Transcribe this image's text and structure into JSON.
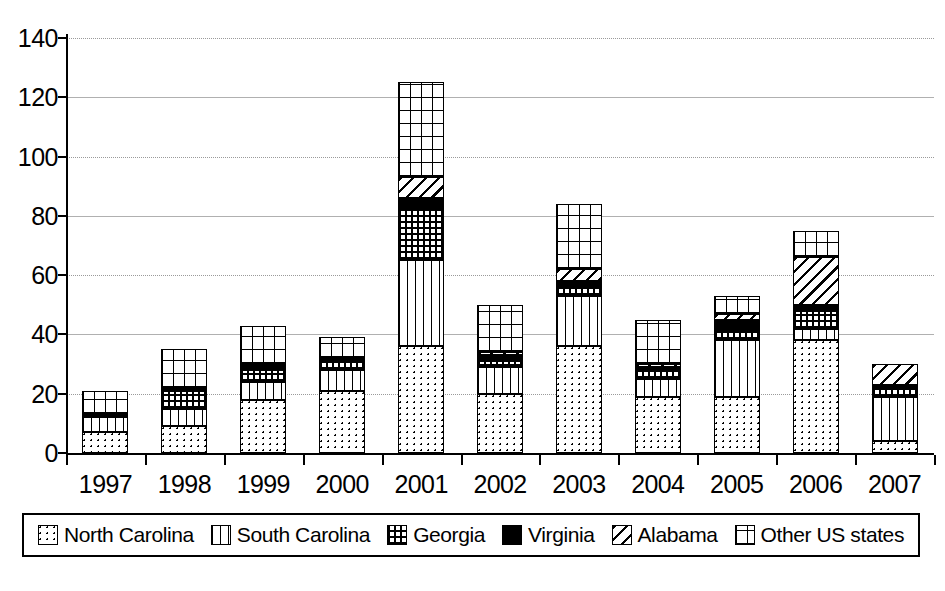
{
  "chart_data": {
    "type": "bar",
    "stacked": true,
    "title": "",
    "xlabel": "",
    "ylabel": "",
    "ylim": [
      0,
      140
    ],
    "ytick_step": 20,
    "yticks": [
      0,
      20,
      40,
      60,
      80,
      100,
      120,
      140
    ],
    "grid": true,
    "legend_position": "bottom",
    "categories": [
      "1997",
      "1998",
      "1999",
      "2000",
      "2001",
      "2002",
      "2003",
      "2004",
      "2005",
      "2006",
      "2007"
    ],
    "series": [
      {
        "name": "North Carolina",
        "pattern": "dots",
        "values": [
          7,
          9,
          18,
          21,
          36,
          20,
          36,
          19,
          19,
          38,
          4
        ]
      },
      {
        "name": "South Carolina",
        "pattern": "vertical-lines",
        "values": [
          5,
          6,
          6,
          7,
          29,
          9,
          17,
          6,
          19,
          4,
          15
        ]
      },
      {
        "name": "Georgia",
        "pattern": "grid-fine",
        "values": [
          0,
          6,
          4,
          3,
          17,
          2,
          3,
          3,
          3,
          6,
          3
        ]
      },
      {
        "name": "Virginia",
        "pattern": "solid-black",
        "values": [
          1,
          1,
          2,
          1,
          4,
          2,
          2,
          1,
          4,
          2,
          1
        ]
      },
      {
        "name": "Alabama",
        "pattern": "diagonal",
        "values": [
          0,
          0,
          0,
          0,
          7,
          1,
          4,
          1,
          2,
          16,
          7
        ]
      },
      {
        "name": "Other US states",
        "pattern": "grid-coarse",
        "values": [
          8,
          13,
          13,
          7,
          32,
          16,
          22,
          15,
          6,
          9,
          0
        ]
      }
    ],
    "totals": [
      21,
      35,
      43,
      39,
      125,
      50,
      84,
      45,
      53,
      75,
      30
    ]
  },
  "legend": {
    "items": [
      {
        "label": "North Carolina",
        "swatch": "dots-swatch"
      },
      {
        "label": "South Carolina",
        "swatch": "vertical-lines-swatch"
      },
      {
        "label": "Georgia",
        "swatch": "grid-fine-swatch"
      },
      {
        "label": "Virginia",
        "swatch": "solid-black-swatch"
      },
      {
        "label": "Alabama",
        "swatch": "diagonal-swatch"
      },
      {
        "label": "Other US states",
        "swatch": "grid-coarse-swatch"
      }
    ]
  },
  "caption": {
    "text": ""
  }
}
